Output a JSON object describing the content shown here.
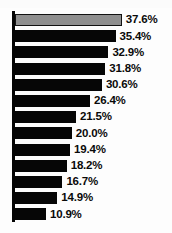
{
  "chart_data": {
    "type": "bar",
    "orientation": "horizontal",
    "title": "",
    "subtitle": "",
    "xlabel": "",
    "ylabel": "",
    "grid": false,
    "legend": "none",
    "xlim": [
      0,
      37.6
    ],
    "categories": [
      "1",
      "2",
      "3",
      "4",
      "5",
      "6",
      "7",
      "8",
      "9",
      "10",
      "11",
      "12",
      "13"
    ],
    "values": [
      37.6,
      35.4,
      32.9,
      31.8,
      30.6,
      26.4,
      21.5,
      20.0,
      19.4,
      18.2,
      16.7,
      14.9,
      10.9
    ],
    "labels": [
      "37.6%",
      "35.4%",
      "32.9%",
      "31.8%",
      "30.6%",
      "26.4%",
      "21.5%",
      "20.0%",
      "19.4%",
      "18.2%",
      "16.7%",
      "14.9%",
      "10.9%"
    ],
    "highlight_index": 0,
    "colors": {
      "bar": "#060606",
      "highlight_bar": "#8f8f8f",
      "highlight_outline": "#121212",
      "axis": "#050505",
      "label_text": "#0a0a0a",
      "background": "#fdfdfd"
    },
    "scale": {
      "pixels_per_unit": 2.84,
      "axis_x": 15
    }
  }
}
